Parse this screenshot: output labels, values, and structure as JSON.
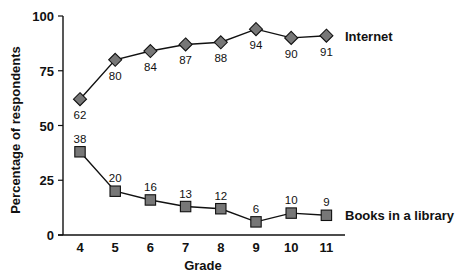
{
  "chart_data": {
    "type": "line",
    "title": "",
    "xlabel": "Grade",
    "ylabel": "Percentage of respondents",
    "categories": [
      "4",
      "5",
      "6",
      "7",
      "8",
      "9",
      "10",
      "11"
    ],
    "x": [
      4,
      5,
      6,
      7,
      8,
      9,
      10,
      11
    ],
    "ylim": [
      0,
      100
    ],
    "yticks": [
      0,
      25,
      50,
      75,
      100
    ],
    "grid": false,
    "legend_position": "inline-right",
    "series": [
      {
        "name": "Internet",
        "marker": "diamond",
        "color": "#777777",
        "values": [
          62,
          80,
          84,
          87,
          88,
          94,
          90,
          91
        ],
        "label_position": "below"
      },
      {
        "name": "Books in a library",
        "marker": "square",
        "color": "#777777",
        "values": [
          38,
          20,
          16,
          13,
          12,
          6,
          10,
          9
        ],
        "label_position": "above"
      }
    ]
  },
  "axes": {
    "x_title": "Grade",
    "y_title": "Percentage of respondents"
  },
  "colors": {
    "marker_fill": "#777777",
    "line": "#111111",
    "text": "#111111"
  }
}
